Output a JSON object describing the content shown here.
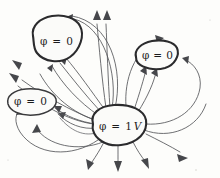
{
  "figure": {
    "name": "electric-field-lines-between-conductors",
    "background_color": "#fdfdfb",
    "line_color": "#55565a",
    "outline_color": "#2b2b2d",
    "text_color": "#1b1b1d",
    "style": "hand-drawn sketch"
  },
  "conductors": [
    {
      "id": "top-left",
      "label_phi": "φ",
      "label_eq": "=",
      "label_value": "0",
      "label_unit": "",
      "potential": "0",
      "outline": "thick"
    },
    {
      "id": "right",
      "label_phi": "φ",
      "label_eq": "=",
      "label_value": "0",
      "label_unit": "",
      "potential": "0",
      "outline": "thick"
    },
    {
      "id": "left-middle",
      "label_phi": "φ",
      "label_eq": "=",
      "label_value": "0",
      "label_unit": "",
      "potential": "0",
      "outline": "thin"
    },
    {
      "id": "center-source",
      "label_phi": "φ",
      "label_eq": "=",
      "label_value": "1",
      "label_unit": "V",
      "potential": "1 V",
      "outline": "thick"
    }
  ],
  "arrows": {
    "count_total": 18,
    "direction_note": "field lines point away from the 1 V conductor and into the 0 V conductors",
    "escaping_to_infinity": 7
  }
}
